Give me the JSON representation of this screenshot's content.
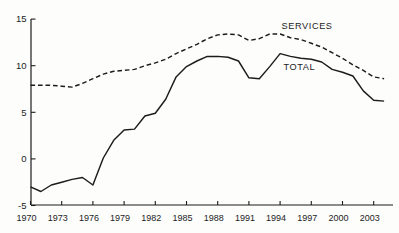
{
  "colors": {
    "line": "#1c1c1c",
    "background": "#fdfdfc"
  },
  "chart_data": {
    "type": "line",
    "title": "",
    "xlabel": "",
    "ylabel": "",
    "grid": false,
    "ylim": [
      -5,
      15
    ],
    "xlim": [
      1970,
      2004
    ],
    "y_tick_labels": [
      "15",
      "10",
      "5",
      "0",
      "-5"
    ],
    "x_tick_labels": [
      "1970",
      "1973",
      "1976",
      "1979",
      "1982",
      "1985",
      "1988",
      "1991",
      "1994",
      "1997",
      "2000",
      "2003"
    ],
    "x": [
      1970,
      1971,
      1972,
      1973,
      1974,
      1975,
      1976,
      1977,
      1978,
      1979,
      1980,
      1981,
      1982,
      1983,
      1984,
      1985,
      1986,
      1987,
      1988,
      1989,
      1990,
      1991,
      1992,
      1993,
      1994,
      1995,
      1996,
      1997,
      1998,
      1999,
      2000,
      2001,
      2002,
      2003,
      2004
    ],
    "series": [
      {
        "name": "SERVICES",
        "line_style": "dashed",
        "values": [
          7.9,
          7.9,
          7.9,
          7.8,
          7.7,
          8.1,
          8.6,
          9.1,
          9.4,
          9.5,
          9.6,
          10.0,
          10.3,
          10.7,
          11.3,
          11.8,
          12.3,
          12.9,
          13.3,
          13.4,
          13.3,
          12.7,
          12.9,
          13.4,
          13.4,
          13.0,
          12.8,
          12.4,
          12.0,
          11.4,
          10.8,
          10.1,
          9.5,
          8.8,
          8.6
        ]
      },
      {
        "name": "TOTAL",
        "line_style": "solid",
        "values": [
          -3.0,
          -3.5,
          -2.8,
          -2.5,
          -2.2,
          -2.0,
          -2.8,
          0.1,
          2.0,
          3.1,
          3.2,
          4.6,
          4.9,
          6.4,
          8.8,
          9.9,
          10.5,
          11.0,
          11.0,
          10.9,
          10.5,
          8.7,
          8.6,
          9.9,
          11.3,
          11.0,
          10.8,
          10.7,
          10.4,
          9.6,
          9.3,
          8.9,
          7.3,
          6.3,
          6.2
        ]
      }
    ],
    "legend_position": "inline-labels"
  }
}
